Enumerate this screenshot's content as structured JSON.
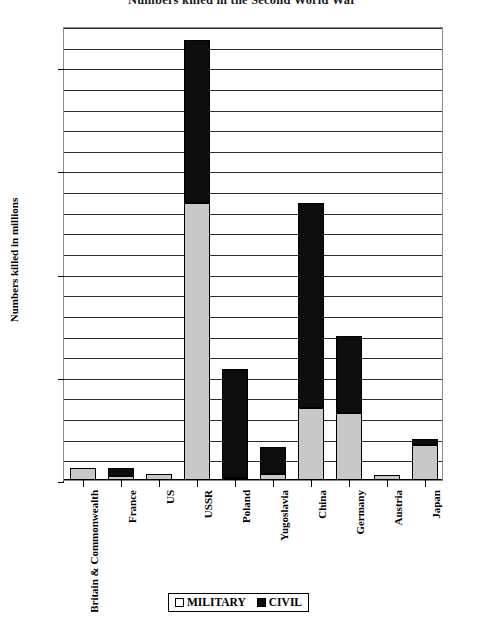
{
  "chart_data": {
    "type": "bar",
    "subtype": "stacked-bar",
    "title": "Numbers killed in the Second World War",
    "xlabel": "",
    "ylabel": "Numbers killed in millions",
    "ylim": [
      0,
      22
    ],
    "ytick_values": [
      0,
      5,
      10,
      15,
      20
    ],
    "ytick_labels": [
      "0",
      "5",
      "10",
      "15",
      "20"
    ],
    "gridline_interval": 1,
    "grid": true,
    "legend_position": "bottom",
    "categories": [
      "Britain & Commonwealth",
      "France",
      "US",
      "USSR",
      "Poland",
      "Yugoslavia",
      "China",
      "Germany",
      "Austria",
      "Japan"
    ],
    "series": [
      {
        "name": "MILITARY",
        "color": "#c8c8c8",
        "values": [
          0.6,
          0.2,
          0.3,
          13.4,
          0.1,
          0.3,
          3.5,
          3.25,
          0.25,
          1.7
        ]
      },
      {
        "name": "CIVIL",
        "color": "#0d0d0d",
        "values": [
          0.0,
          0.4,
          0.0,
          7.9,
          5.3,
          1.3,
          9.9,
          3.75,
          0.0,
          0.3
        ]
      }
    ],
    "totals": [
      0.6,
      0.6,
      0.3,
      21.3,
      5.4,
      1.6,
      13.4,
      7.0,
      0.25,
      2.0
    ]
  },
  "legend": {
    "items": [
      {
        "label": "MILITARY",
        "swatch": "military"
      },
      {
        "label": "CIVIL",
        "swatch": "civil"
      }
    ]
  }
}
